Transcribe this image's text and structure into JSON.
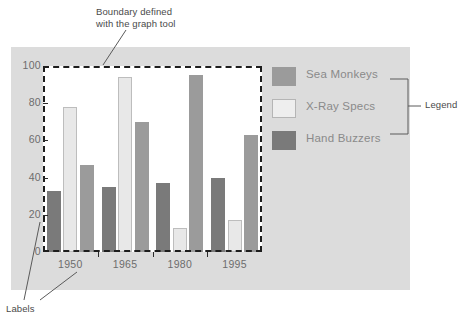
{
  "annotations": {
    "boundary": "Boundary defined\nwith the graph tool",
    "labels": "Labels",
    "legend": "Legend"
  },
  "colors": {
    "panel_background": "#dcdcdc",
    "plot_background": "#ffffff",
    "sea_monkeys": "#9b9b9b",
    "xray_specs": "#e8e8e8",
    "hand_buzzers": "#7a7a7a",
    "axis": "#2b2b2b",
    "tick_text": "#6d6d6d",
    "legend_text": "#8a8a8a",
    "annotation_text": "#4a4a4a",
    "boundary_dash": "#1d1d1d"
  },
  "legend": {
    "items": [
      {
        "label": "Sea Monkeys",
        "key": "sea_monkeys",
        "swatch": "sm"
      },
      {
        "label": "X-Ray Specs",
        "key": "xray_specs",
        "swatch": "xr"
      },
      {
        "label": "Hand Buzzers",
        "key": "hand_buzzers",
        "swatch": "hb"
      }
    ]
  },
  "chart_data": {
    "type": "bar",
    "title": "",
    "xlabel": "",
    "ylabel": "",
    "ylim": [
      0,
      100
    ],
    "yticks": [
      0,
      20,
      40,
      60,
      80,
      100
    ],
    "grid": false,
    "legend_position": "right",
    "categories": [
      "1950",
      "1965",
      "1980",
      "1995"
    ],
    "bar_order": [
      "Hand Buzzers",
      "X-Ray Specs",
      "Sea Monkeys"
    ],
    "series": [
      {
        "name": "Hand Buzzers",
        "color": "#7a7a7a",
        "values": [
          33,
          35,
          37,
          40
        ]
      },
      {
        "name": "X-Ray Specs",
        "color": "#e8e8e8",
        "values": [
          78,
          94,
          13,
          17
        ]
      },
      {
        "name": "Sea Monkeys",
        "color": "#9b9b9b",
        "values": [
          47,
          70,
          95,
          63
        ]
      }
    ],
    "annotations": [
      {
        "text": "Boundary defined with the graph tool",
        "target": "plot-boundary"
      },
      {
        "text": "Labels",
        "target": "axis-tick-labels"
      },
      {
        "text": "Legend",
        "target": "legend-block"
      }
    ]
  }
}
